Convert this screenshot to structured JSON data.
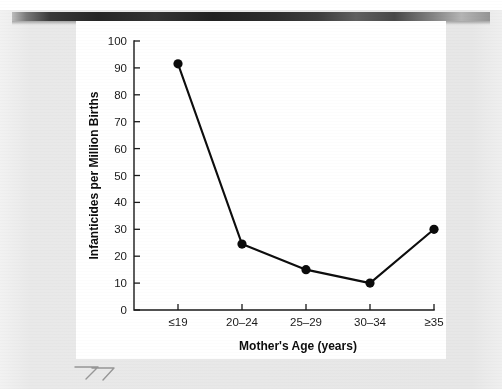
{
  "document": {
    "kind": "scanned-textbook-figure",
    "page_background_color": "#e8e8e8",
    "figure_card_color": "#ffffff",
    "scan_top_band_color": "#1a1a1a",
    "handwritten_mark": "77"
  },
  "chart_data": {
    "type": "line",
    "title": "",
    "subtitle": "",
    "xlabel": "Mother's Age (years)",
    "ylabel": "Infanticides per Million Births",
    "categories": [
      "≤19",
      "20–24",
      "25–29",
      "30–34",
      "≥35"
    ],
    "values": [
      91.5,
      24.5,
      15,
      10,
      30
    ],
    "series": [
      {
        "name": "Infanticides per Million Births",
        "values": [
          91.5,
          24.5,
          15,
          10,
          30
        ],
        "color": "#0b0b0b",
        "marker": "filled-circle"
      }
    ],
    "ylim": [
      0,
      100
    ],
    "ytick_values": [
      0,
      10,
      20,
      30,
      40,
      50,
      60,
      70,
      80,
      90,
      100
    ],
    "ytick_labels": [
      "0",
      "10",
      "20",
      "30",
      "40",
      "50",
      "60",
      "70",
      "80",
      "90",
      "100"
    ],
    "xtick_labels": [
      "≤19",
      "20–24",
      "25–29",
      "30–34",
      "≥35"
    ],
    "grid": false,
    "legend": false,
    "legend_position": "none",
    "annotations": []
  }
}
